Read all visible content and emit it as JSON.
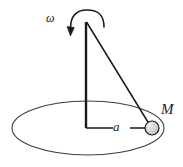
{
  "figure": {
    "name": "conical-pendulum-diagram",
    "background_color": "#ffffff",
    "stroke_color": "#1a1a1a"
  },
  "labels": {
    "angular_velocity": "ω",
    "radius": "a",
    "mass": "M"
  },
  "geometry": {
    "apex": {
      "x": 86,
      "y": 22
    },
    "axis_base": {
      "x": 86,
      "y": 128
    },
    "mass_center": {
      "x": 152,
      "y": 128
    },
    "ellipse": {
      "cx": 88,
      "cy": 128,
      "rx": 76,
      "ry": 27
    },
    "mass_radius": 7,
    "radius_line_gap": {
      "start": 113,
      "end": 130
    },
    "rotation_arc": {
      "cx": 87,
      "cy": 24,
      "rx": 17,
      "ry": 13
    }
  },
  "elements": {
    "vertical_axis": "vertical-axis-line",
    "string": "pendulum-string-line",
    "radius_line": "radius-line",
    "circular_path": "circular-path-ellipse",
    "mass_bob": "mass-bob-circle",
    "rotation_arrow": "rotation-direction-arrow"
  },
  "colors": {
    "line": "#1a1a1a",
    "ellipse_line": "#3c3c3c",
    "bob_fill": "#c9c9c9",
    "text": "#1a1a1a"
  }
}
